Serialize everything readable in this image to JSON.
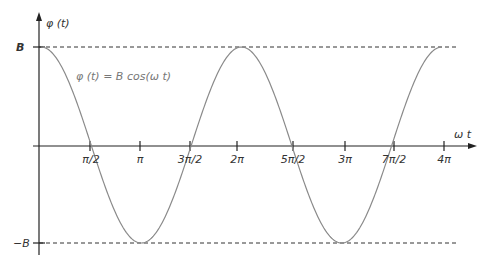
{
  "chart_data": {
    "type": "line",
    "title": "",
    "xlabel": "ω t",
    "ylabel": "φ (t)",
    "annotation": "φ (t) = B cos(ω t)",
    "y_levels": {
      "upper": "B",
      "lower": "−B"
    },
    "x_ticks": [
      "π/2",
      "π",
      "3π/2",
      "2π",
      "5π/2",
      "3π",
      "7π/2",
      "4π"
    ],
    "x_range": [
      0,
      "4π"
    ],
    "series": [
      {
        "name": "φ (t) = B cos(ω t)",
        "function": "B cos(ω t)",
        "x": [
          "0",
          "π/2",
          "π",
          "3π/2",
          "2π",
          "5π/2",
          "3π",
          "7π/2",
          "4π"
        ],
        "values": [
          1,
          0,
          -1,
          0,
          1,
          0,
          -1,
          0,
          1
        ]
      }
    ],
    "grid": false,
    "reference_lines": [
      "B (dashed)",
      "−B (dashed)"
    ],
    "colors": {
      "curve": "#8a8a8a",
      "axis": "#222222",
      "dashed": "#333333"
    }
  }
}
